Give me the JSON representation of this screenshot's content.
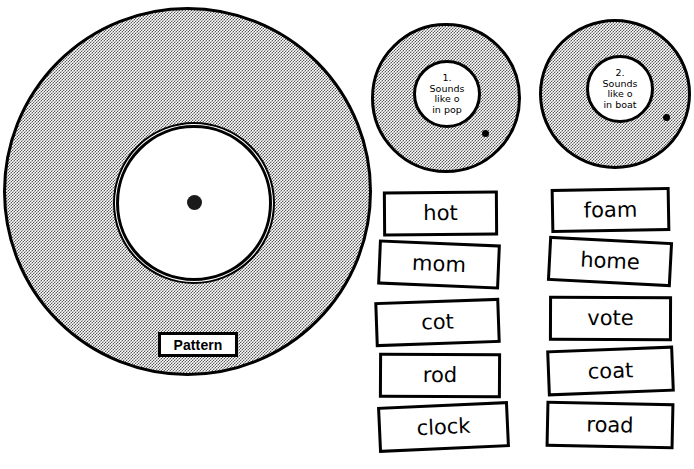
{
  "worksheet": {
    "title": "Vowel Sound Sorting Wheel Worksheet",
    "pattern_wheel": {
      "label": "Pattern",
      "center_dot": "center-pivot-dot"
    },
    "sorting_wheels": [
      {
        "number": "1.",
        "line1": "Sounds",
        "line2": "like  o",
        "line3": "in pop",
        "full_text": "1. Sounds like o in pop"
      },
      {
        "number": "2.",
        "line1": "Sounds",
        "line2": "like o",
        "line3": "in boat",
        "full_text": "2. Sounds like o in boat"
      }
    ],
    "word_cards": {
      "left_column": [
        "hot",
        "mom",
        "cot",
        "rod",
        "clock"
      ],
      "right_column": [
        "foam",
        "home",
        "vote",
        "coat",
        "road"
      ]
    }
  },
  "colors": {
    "ink": "#000000",
    "paper": "#ffffff",
    "halftone_gray": "#b8b8b8"
  }
}
